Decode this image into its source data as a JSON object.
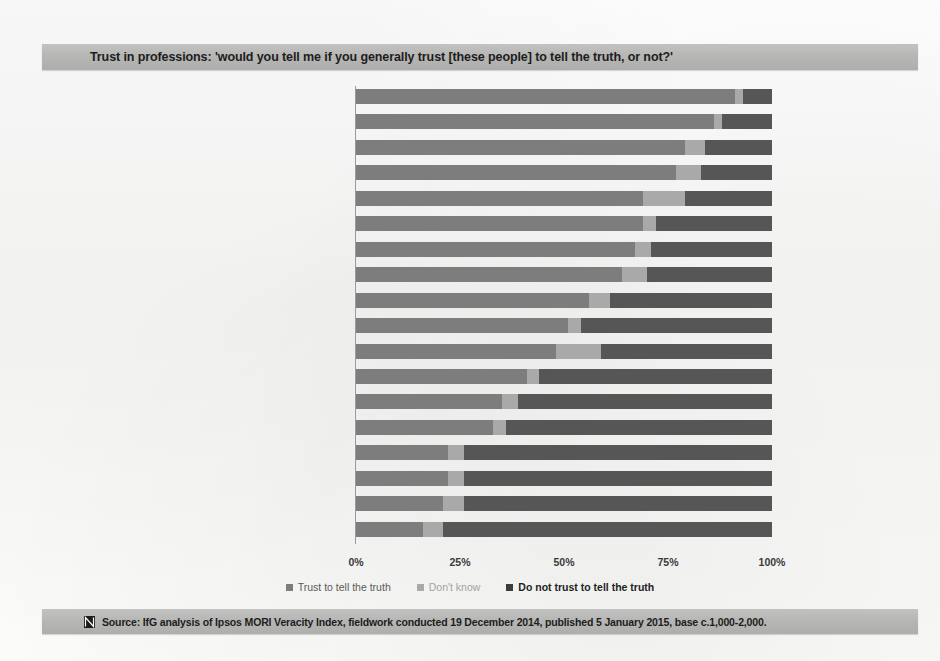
{
  "title": "Trust in professions: 'would you tell me if you generally trust [these people] to tell the truth, or not?'",
  "source": {
    "mark": "ifg-logo-icon",
    "text": "Source: IfG analysis of Ipsos MORI Veracity Index, fieldwork conducted 19 December 2014, published 5 January 2015, base c.1,000-2,000."
  },
  "legend": [
    {
      "label": "Trust to tell the truth",
      "color": "#7d7d7d"
    },
    {
      "label": "Don't know",
      "color": "#a9a9a9"
    },
    {
      "label": "Do not trust to tell the truth",
      "color": "#3d3d3d"
    }
  ],
  "axis": {
    "ticks": [
      "0%",
      "25%",
      "50%",
      "75%",
      "100%"
    ],
    "tick_values": [
      0,
      25,
      50,
      75,
      100
    ]
  },
  "colors": {
    "trust": "#7d7d7d",
    "dont_know": "#a9a9a9",
    "distrust": "#565656",
    "band": "#b5b5b3",
    "page": "#fbfbfa"
  },
  "chart_data": {
    "type": "bar",
    "orientation": "horizontal",
    "stacked": true,
    "title": "Trust in professions: 'would you tell me if you generally trust [these people] to tell the truth, or not?'",
    "xlabel": "",
    "ylabel": "",
    "xlim": [
      0,
      100
    ],
    "grid": false,
    "legend_position": "bottom",
    "categories": [
      "Doctors",
      "Teachers",
      "Scientists",
      "Judges",
      "Clergy/priests",
      "TV newsreaders",
      "The police",
      "Ordinary man/woman in the street",
      "Civil servants",
      "Pollsters",
      "Managers in the NHS",
      "Trade Union officials",
      "Business leaders",
      "Bankers",
      "Journalists",
      "Estate agents",
      "Government ministers",
      "Politicians generally"
    ],
    "series": [
      {
        "name": "Trust to tell the truth",
        "values": [
          91,
          86,
          79,
          77,
          69,
          69,
          67,
          64,
          56,
          51,
          48,
          41,
          35,
          33,
          22,
          22,
          21,
          16
        ]
      },
      {
        "name": "Don't know",
        "values": [
          2,
          2,
          5,
          6,
          10,
          3,
          4,
          6,
          5,
          3,
          11,
          3,
          4,
          3,
          4,
          4,
          5,
          5
        ]
      },
      {
        "name": "Do not trust to tell the truth",
        "values": [
          7,
          12,
          16,
          17,
          21,
          28,
          29,
          30,
          39,
          46,
          41,
          56,
          61,
          64,
          74,
          74,
          74,
          79
        ]
      }
    ]
  }
}
